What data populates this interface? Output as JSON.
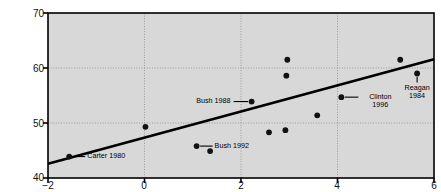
{
  "figure": {
    "background": "#d8d8d8",
    "frame_color": "#000000",
    "grid_color": "#9a9a9a",
    "point_color": "#111111",
    "line_color": "#000000"
  },
  "chart_data": {
    "type": "scatter",
    "title": "",
    "xlabel": "",
    "ylabel": "Percentage of vote for incumbent party",
    "xlim": [
      -2,
      6
    ],
    "ylim": [
      40,
      70
    ],
    "xticks": [
      -2,
      0,
      2,
      4,
      6
    ],
    "xtick_labels": [
      "−2",
      "0",
      "2",
      "4",
      "6"
    ],
    "yticks": [
      40,
      50,
      60,
      70
    ],
    "ytick_labels": [
      "40",
      "50",
      "60",
      "70"
    ],
    "grid": true,
    "grid_style": "dotted",
    "legend": "none",
    "points": [
      {
        "x": -1.56,
        "y": 43.9,
        "label": "Carter 1980"
      },
      {
        "x": 0.02,
        "y": 49.3,
        "label": ""
      },
      {
        "x": 1.08,
        "y": 45.8,
        "label": "Bush 1992"
      },
      {
        "x": 1.36,
        "y": 44.9,
        "label": ""
      },
      {
        "x": 2.22,
        "y": 53.9,
        "label": "Bush 1988"
      },
      {
        "x": 2.58,
        "y": 48.3,
        "label": ""
      },
      {
        "x": 2.92,
        "y": 48.7,
        "label": ""
      },
      {
        "x": 2.96,
        "y": 61.5,
        "label": ""
      },
      {
        "x": 2.94,
        "y": 58.6,
        "label": ""
      },
      {
        "x": 3.58,
        "y": 51.4,
        "label": ""
      },
      {
        "x": 4.08,
        "y": 54.7,
        "label": "Clinton 1996"
      },
      {
        "x": 5.3,
        "y": 61.5,
        "label": ""
      },
      {
        "x": 5.65,
        "y": 59.0,
        "label": "Reagan 1984"
      }
    ],
    "fit_line": {
      "type": "linear",
      "x_start": -2,
      "y_start": 42.6,
      "x_end": 6,
      "y_end": 61.6
    },
    "annotations": [
      {
        "text": "Carter 1980",
        "point_x": -1.56,
        "point_y": 43.9,
        "side": "right"
      },
      {
        "text": "Bush 1992",
        "point_x": 1.08,
        "point_y": 45.8,
        "side": "right"
      },
      {
        "text": "Bush 1988",
        "point_x": 2.22,
        "point_y": 53.9,
        "side": "left"
      },
      {
        "text": "Clinton 1996",
        "point_x": 4.08,
        "point_y": 54.7,
        "side": "right"
      },
      {
        "text": "Reagan 1984",
        "point_x": 5.65,
        "point_y": 59.0,
        "side": "below"
      }
    ],
    "annotation_lines": {
      "clinton_line1": "Clinton",
      "clinton_line2": "1996",
      "reagan_line1": "Reagan",
      "reagan_line2": "1984"
    }
  }
}
